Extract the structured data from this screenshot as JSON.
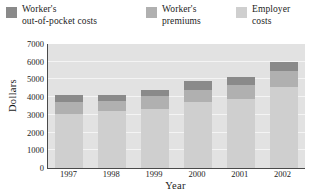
{
  "chart_data": {
    "type": "bar",
    "subtype": "stacked-vertical",
    "title": "",
    "xlabel": "Year",
    "ylabel": "Dollars",
    "categories": [
      "1997",
      "1998",
      "1999",
      "2000",
      "2001",
      "2002"
    ],
    "ylim": [
      0,
      7000
    ],
    "ytick_values": [
      0,
      1000,
      2000,
      3000,
      4000,
      5000,
      6000,
      7000
    ],
    "ytick_labels": [
      "0",
      "1000",
      "2000",
      "3000",
      "4000",
      "5000",
      "6000",
      "7000"
    ],
    "grid": true,
    "grid_axis": "y",
    "legend_position": "top",
    "stack_order_bottom_to_top": [
      "Employer costs",
      "Worker's premiums",
      "Worker's out-of-pocket costs"
    ],
    "series": [
      {
        "name": "Employer costs",
        "legend_label": "Employer\ncosts",
        "color": "#cfcfcf",
        "values": [
          3050,
          3200,
          3350,
          3700,
          3900,
          4550
        ]
      },
      {
        "name": "Worker's premiums",
        "legend_label": "Worker's\npremiums",
        "color": "#b0b0b0",
        "values": [
          700,
          600,
          700,
          700,
          800,
          950
        ]
      },
      {
        "name": "Worker's out-of-pocket costs",
        "legend_label": "Worker's\nout-of-pocket costs",
        "color": "#8a8a8a",
        "values": [
          350,
          350,
          350,
          500,
          450,
          500
        ]
      }
    ],
    "totals": [
      4100,
      4150,
      4400,
      4900,
      5150,
      6000
    ],
    "plot_background": "#e2e2e2",
    "gridline_color": "#f4f4f4",
    "axis_color": "#4a4a4a"
  },
  "legend": {
    "entries": [
      {
        "label": "Worker's\nout-of-pocket costs",
        "color": "#8a8a8a"
      },
      {
        "label": "Worker's\npremiums",
        "color": "#b0b0b0"
      },
      {
        "label": "Employer\ncosts",
        "color": "#cfcfcf"
      }
    ]
  }
}
